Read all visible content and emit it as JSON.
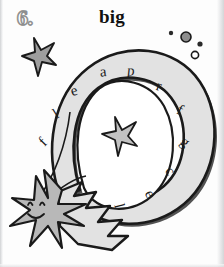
{
  "page": {
    "background_color": "#fdfdfd",
    "width": 224,
    "height": 267
  },
  "exercise": {
    "number_label": "6.",
    "headword": "big"
  },
  "artwork": {
    "description_name": "comet-spiral-illustration",
    "spiral_fill_color": "#e2e2e2",
    "ink_color": "#1a1a1a",
    "star_fill_color": "#b8b8b8"
  },
  "letters": [
    {
      "char": "e",
      "x": 74,
      "y": 91,
      "rotate": -18
    },
    {
      "char": "a",
      "x": 103,
      "y": 72,
      "rotate": -6
    },
    {
      "char": "p",
      "x": 131,
      "y": 71,
      "rotate": 6
    },
    {
      "char": "r",
      "x": 159,
      "y": 86,
      "rotate": 16
    },
    {
      "char": "f",
      "x": 180,
      "y": 110,
      "rotate": 26
    },
    {
      "char": "g",
      "x": 185,
      "y": 142,
      "rotate": 38
    },
    {
      "char": "c",
      "x": 170,
      "y": 171,
      "rotate": 52
    },
    {
      "char": "e",
      "x": 150,
      "y": 194,
      "rotate": 64
    },
    {
      "char": "l",
      "x": 119,
      "y": 206,
      "rotate": 76
    },
    {
      "char": "l",
      "x": 56,
      "y": 114,
      "rotate": -32
    },
    {
      "char": "f",
      "x": 43,
      "y": 142,
      "rotate": -46
    }
  ],
  "decorations": {
    "corner_star_name": "small-star-top-left",
    "center_star_name": "small-star-center",
    "comet_star_name": "smiling-comet-star",
    "bubbles_name": "dot-cluster-top-right",
    "bubbles": [
      {
        "cx": 171,
        "cy": 33,
        "r": 2.2,
        "filled": true
      },
      {
        "cx": 186,
        "cy": 37,
        "r": 5.0,
        "filled": true
      },
      {
        "cx": 200,
        "cy": 44,
        "r": 2.6,
        "filled": true
      },
      {
        "cx": 195,
        "cy": 55,
        "r": 3.6,
        "filled": false
      }
    ]
  }
}
